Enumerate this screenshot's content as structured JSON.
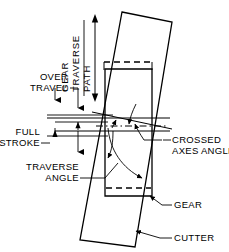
{
  "diagram": {
    "background_color": "#ffffff",
    "line_color": "#000000",
    "labels": {
      "gear_traverse_path_line1": "GEAR",
      "gear_traverse_path_line2": "TRAVERSE",
      "gear_traverse_path_line3": "PATH",
      "over_travel_line1": "OVER",
      "over_travel_line2": "TRAVEL",
      "full_stroke_line1": "FULL",
      "full_stroke_line2": "STROKE",
      "traverse_angle_line1": "TRAVERSE",
      "traverse_angle_line2": "ANGLE",
      "crossed_axes_angle_line1": "CROSSED",
      "crossed_axes_angle_line2": "AXES ANGLE",
      "gear": "GEAR",
      "cutter": "CUTTER"
    },
    "parts": {
      "cutter_outline": "tilted-rectangle",
      "gear_outline": "upright-rectangle",
      "gear_overtravel_top": "dashed-rectangle-top",
      "gear_overtravel_bottom": "dashed-line-bottom",
      "traverse_arrow": "double-headed-vertical-arrow",
      "crossed_axes_arc": "angle-arc",
      "traverse_angle_arc": "angle-arc"
    }
  }
}
